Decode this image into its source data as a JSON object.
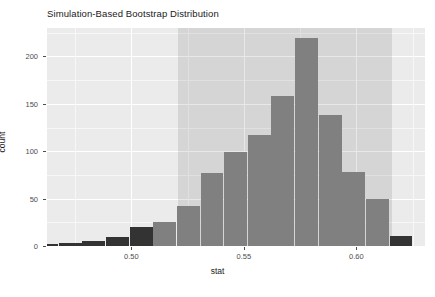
{
  "chart_data": {
    "type": "bar",
    "title": "Simulation-Based Bootstrap Distribution",
    "xlabel": "stat",
    "ylabel": "count",
    "xlim": [
      0.4625,
      0.6305
    ],
    "ylim": [
      0,
      230
    ],
    "grid": true,
    "legend": null,
    "bin_width": 0.0105,
    "categories": [
      "0.4625",
      "0.4730",
      "0.4835",
      "0.4940",
      "0.5045",
      "0.5150",
      "0.5255",
      "0.5360",
      "0.5465",
      "0.5570",
      "0.5675",
      "0.5780",
      "0.5885",
      "0.5990",
      "0.6095",
      "0.6200"
    ],
    "values": [
      2,
      3,
      5,
      9,
      20,
      25,
      42,
      77,
      99,
      117,
      158,
      219,
      138,
      78,
      50,
      11
    ],
    "bar_colors": [
      "dark",
      "dark",
      "dark",
      "dark",
      "dark",
      "gray",
      "gray",
      "gray",
      "gray",
      "gray",
      "gray",
      "gray",
      "gray",
      "gray",
      "gray",
      "dark"
    ],
    "yticks": [
      0,
      50,
      100,
      150,
      200
    ],
    "ytick_labels": [
      "0",
      "50",
      "100",
      "150",
      "200"
    ],
    "xticks": [
      0.5,
      0.55,
      0.6
    ],
    "xtick_labels": [
      "0.50",
      "0.55",
      "0.60"
    ],
    "confidence_interval": {
      "low": 0.5205,
      "high": 0.616
    },
    "colors": {
      "bar_inside": "#808080",
      "bar_outside": "#333333",
      "panel_background": "#ebebeb",
      "gridline": "#ffffff",
      "ci_shade": "rgba(0,0,0,0.09)",
      "text": "#1a1a1a",
      "axis_text": "#4d4d4d"
    }
  }
}
